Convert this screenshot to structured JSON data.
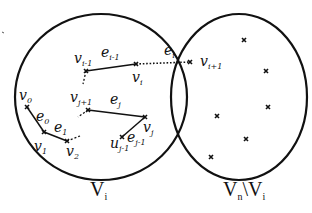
{
  "diagram": {
    "sets": {
      "left_label": "V",
      "left_sub": "i",
      "right_label_a": "V",
      "right_sub_a": "n",
      "right_sep": "\\",
      "right_label_b": "V",
      "right_sub_b": "i"
    },
    "vertices": {
      "v0": {
        "base": "v",
        "sub": "0"
      },
      "v1": {
        "base": "v",
        "sub": "1"
      },
      "v2": {
        "base": "v",
        "sub": "2"
      },
      "vi_1": {
        "base": "v",
        "sub": "i-1"
      },
      "vi": {
        "base": "v",
        "sub": "i"
      },
      "vi1": {
        "base": "v",
        "sub": "i+1"
      },
      "vj1": {
        "base": "v",
        "sub": "j+1"
      },
      "vj": {
        "base": "v",
        "sub": "j"
      },
      "vj_1": {
        "base": "u",
        "sub": "j-1"
      }
    },
    "edges": {
      "e0": {
        "base": "e",
        "sub": "0"
      },
      "e1": {
        "base": "e",
        "sub": "1"
      },
      "ei_1": {
        "base": "e",
        "sub": "i-1"
      },
      "ei": {
        "base": "e",
        "sub": "i"
      },
      "ej": {
        "base": "e",
        "sub": "j"
      },
      "ej_1": {
        "base": "e",
        "sub": "j-1"
      }
    },
    "stroke_color": "#111111"
  }
}
